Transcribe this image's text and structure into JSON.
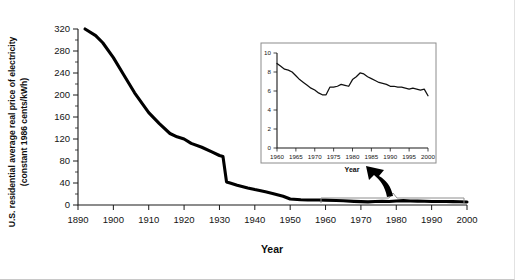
{
  "chart_data": [
    {
      "id": "main",
      "type": "line",
      "title": "",
      "xlabel": "Year",
      "ylabel": "U.S. residential average real price of electricity (constant 1986 cents/kWh)",
      "ylabel_line1": "U.S. residential average real price of electricity",
      "ylabel_line2": "(constant 1986 cents/kWh)",
      "xlim": [
        1890,
        2000
      ],
      "ylim": [
        0,
        320
      ],
      "xticks": [
        1890,
        1900,
        1910,
        1920,
        1930,
        1940,
        1950,
        1960,
        1970,
        1980,
        1990,
        2000
      ],
      "xticklabels": [
        "1890",
        "1900",
        "1910",
        "1920",
        "1930",
        "1940",
        "1950",
        "1960",
        "1970",
        "1980",
        "1990",
        "2000"
      ],
      "yticks": [
        0,
        40,
        80,
        120,
        160,
        200,
        240,
        280,
        320
      ],
      "yticklabels": [
        "0",
        "40",
        "80",
        "120",
        "160",
        "200",
        "240",
        "280",
        "320"
      ],
      "y_minor_step": 20,
      "x_minor_step": 5,
      "grid": false,
      "legend": "none",
      "line_color": "#000000",
      "x": [
        1892,
        1895,
        1897,
        1900,
        1903,
        1906,
        1910,
        1913,
        1916,
        1918,
        1920,
        1922,
        1925,
        1928,
        1930,
        1931,
        1932,
        1933,
        1935,
        1938,
        1940,
        1943,
        1945,
        1948,
        1950,
        1953,
        1955,
        1958,
        1960,
        1963,
        1965,
        1968,
        1970,
        1972,
        1974,
        1976,
        1978,
        1980,
        1982,
        1984,
        1986,
        1988,
        1990,
        1992,
        1994,
        1996,
        1998,
        2000
      ],
      "y": [
        320,
        308,
        295,
        268,
        236,
        204,
        168,
        148,
        130,
        124,
        120,
        112,
        105,
        96,
        90,
        88,
        42,
        40,
        36,
        31,
        28,
        24,
        21,
        16,
        11,
        9.6,
        9.2,
        9.0,
        8.9,
        8.2,
        7.6,
        6.6,
        6.1,
        5.6,
        6.4,
        6.6,
        6.5,
        7.2,
        7.9,
        7.4,
        7.0,
        6.8,
        6.5,
        6.4,
        6.3,
        6.2,
        6.0,
        5.5
      ]
    },
    {
      "id": "inset",
      "type": "line",
      "title": "",
      "xlabel": "Year",
      "ylabel": "",
      "xlim": [
        1960,
        2000
      ],
      "ylim": [
        0,
        10
      ],
      "xticks": [
        1960,
        1965,
        1970,
        1975,
        1980,
        1985,
        1990,
        1995,
        2000
      ],
      "xticklabels": [
        "1960",
        "1965",
        "1970",
        "1975",
        "1980",
        "1985",
        "1990",
        "1995",
        "2000"
      ],
      "yticks": [
        0,
        2,
        4,
        6,
        8,
        10
      ],
      "yticklabels": [
        "0",
        "2",
        "4",
        "6",
        "8",
        "10"
      ],
      "grid": false,
      "legend": "none",
      "line_color": "#101010",
      "x": [
        1960,
        1961,
        1962,
        1963,
        1964,
        1965,
        1966,
        1967,
        1968,
        1969,
        1970,
        1971,
        1972,
        1973,
        1974,
        1975,
        1976,
        1977,
        1978,
        1979,
        1980,
        1981,
        1982,
        1983,
        1984,
        1985,
        1986,
        1987,
        1988,
        1989,
        1990,
        1991,
        1992,
        1993,
        1994,
        1995,
        1996,
        1997,
        1998,
        1999,
        2000
      ],
      "y": [
        8.9,
        8.6,
        8.3,
        8.2,
        8.0,
        7.6,
        7.2,
        6.9,
        6.6,
        6.3,
        6.1,
        5.8,
        5.6,
        5.6,
        6.4,
        6.4,
        6.5,
        6.7,
        6.6,
        6.5,
        7.2,
        7.5,
        7.9,
        7.8,
        7.5,
        7.3,
        7.1,
        6.9,
        6.8,
        6.7,
        6.5,
        6.5,
        6.4,
        6.4,
        6.3,
        6.2,
        6.3,
        6.2,
        6.1,
        6.2,
        5.5
      ]
    }
  ],
  "main_axis": {
    "xlabel": "Year",
    "ylabel_line1": "U.S. residential average real price of electricity",
    "ylabel_line2": "(constant 1986 cents/kWh)",
    "xticklabels": [
      "1890",
      "1900",
      "1910",
      "1920",
      "1930",
      "1940",
      "1950",
      "1960",
      "1970",
      "1980",
      "1990",
      "2000"
    ],
    "yticklabels": [
      "0",
      "40",
      "80",
      "120",
      "160",
      "200",
      "240",
      "280",
      "320"
    ]
  },
  "inset_axis": {
    "xlabel": "Year",
    "xticklabels": [
      "1960",
      "1965",
      "1970",
      "1975",
      "1980",
      "1985",
      "1990",
      "1995",
      "2000"
    ],
    "yticklabels": [
      "0",
      "2",
      "4",
      "6",
      "8",
      "10"
    ]
  },
  "annotation": {
    "callout_name": "inset-pointer-arrow",
    "brace_range": "1960-2000"
  },
  "colors": {
    "main_line": "#000000",
    "inset_line": "#101010",
    "axis": "#1a1a1a",
    "frame": "#8c8c8c",
    "text": "#0d0d0d"
  }
}
